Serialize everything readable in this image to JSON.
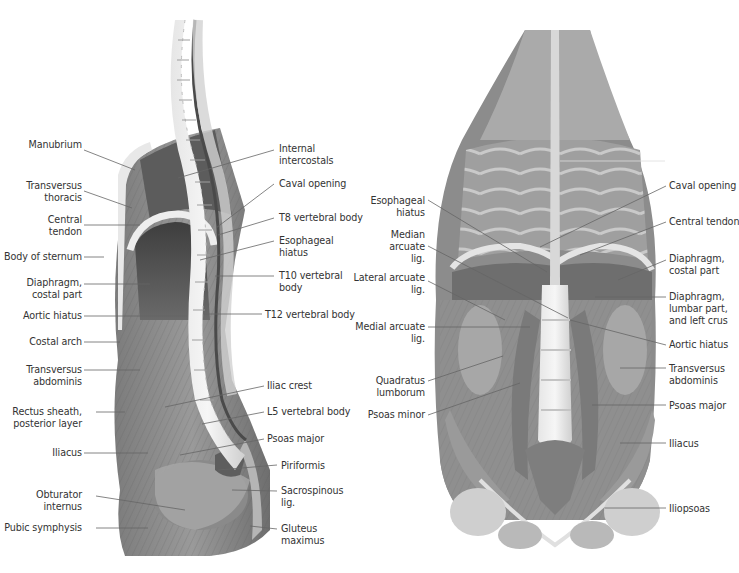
{
  "figure": {
    "panels": [
      {
        "id": "lateral",
        "view": "Midsagittal section, left lateral view",
        "left_labels": [
          {
            "lines": [
              "Manubrium"
            ],
            "x": 22,
            "y": 144
          },
          {
            "lines": [
              "Transversus",
              "thoracis"
            ],
            "x": 22,
            "y": 182
          },
          {
            "lines": [
              "Central",
              "tendon"
            ],
            "x": 22,
            "y": 219
          },
          {
            "lines": [
              "Body of sternum"
            ],
            "x": 22,
            "y": 251
          },
          {
            "lines": [
              "Diaphragm,",
              "costal part"
            ],
            "x": 22,
            "y": 277
          },
          {
            "lines": [
              "Aortic hiatus"
            ],
            "x": 22,
            "y": 310
          },
          {
            "lines": [
              "Costal arch"
            ],
            "x": 22,
            "y": 337
          },
          {
            "lines": [
              "Transversus",
              "abdominis"
            ],
            "x": 22,
            "y": 365
          },
          {
            "lines": [
              "Rectus sheath,",
              "posterior layer"
            ],
            "x": 22,
            "y": 406
          },
          {
            "lines": [
              "Iliacus"
            ],
            "x": 22,
            "y": 448
          },
          {
            "lines": [
              "Obturator",
              "internus"
            ],
            "x": 22,
            "y": 490
          },
          {
            "lines": [
              "Pubic symphysis"
            ],
            "x": 22,
            "y": 523
          }
        ],
        "right_labels": [
          {
            "lines": [
              "Internal",
              "intercostals"
            ],
            "x": 279,
            "y": 143
          },
          {
            "lines": [
              "Caval opening"
            ],
            "x": 279,
            "y": 178
          },
          {
            "lines": [
              "T8 vertebral body"
            ],
            "x": 279,
            "y": 212
          },
          {
            "lines": [
              "Esophageal",
              "hiatus"
            ],
            "x": 279,
            "y": 235
          },
          {
            "lines": [
              "T10 vertebral",
              "body"
            ],
            "x": 279,
            "y": 270
          },
          {
            "lines": [
              "T12 vertebral body"
            ],
            "x": 265,
            "y": 309
          },
          {
            "lines": [
              "Iliac crest"
            ],
            "x": 267,
            "y": 380
          },
          {
            "lines": [
              "L5 vertebral body"
            ],
            "x": 267,
            "y": 406
          },
          {
            "lines": [
              "Psoas major"
            ],
            "x": 267,
            "y": 433
          },
          {
            "lines": [
              "Piriformis"
            ],
            "x": 281,
            "y": 460
          },
          {
            "lines": [
              "Sacrospinous",
              "lig."
            ],
            "x": 281,
            "y": 485
          },
          {
            "lines": [
              "Gluteus",
              "maximus"
            ],
            "x": 281,
            "y": 523
          }
        ]
      },
      {
        "id": "anterior",
        "view": "Posterior abdominal wall, anterior view",
        "left_labels": [
          {
            "lines": [
              "Esophageal",
              "hiatus"
            ],
            "x": 425,
            "y": 195
          },
          {
            "lines": [
              "Median",
              "arcuate",
              "lig."
            ],
            "x": 425,
            "y": 229
          },
          {
            "lines": [
              "Lateral arcuate",
              "lig."
            ],
            "x": 425,
            "y": 272
          },
          {
            "lines": [
              "Medial arcuate",
              "lig."
            ],
            "x": 425,
            "y": 321
          },
          {
            "lines": [
              "Quadratus",
              "lumborum"
            ],
            "x": 425,
            "y": 375
          },
          {
            "lines": [
              "Psoas minor"
            ],
            "x": 425,
            "y": 409
          }
        ],
        "right_labels": [
          {
            "lines": [
              "Caval opening"
            ],
            "x": 669,
            "y": 180
          },
          {
            "lines": [
              "Central tendon"
            ],
            "x": 669,
            "y": 216
          },
          {
            "lines": [
              "Diaphragm,",
              "costal part"
            ],
            "x": 669,
            "y": 253
          },
          {
            "lines": [
              "Diaphragm,",
              "lumbar part,",
              "and left crus"
            ],
            "x": 669,
            "y": 291
          },
          {
            "lines": [
              "Aortic hiatus"
            ],
            "x": 669,
            "y": 339
          },
          {
            "lines": [
              "Transversus",
              "abdominis"
            ],
            "x": 669,
            "y": 364
          },
          {
            "lines": [
              "Psoas major"
            ],
            "x": 669,
            "y": 400
          },
          {
            "lines": [
              "Iliacus"
            ],
            "x": 669,
            "y": 438
          },
          {
            "lines": [
              "Iliopsoas"
            ],
            "x": 669,
            "y": 503
          }
        ]
      }
    ],
    "colors": {
      "background": "#ffffff",
      "label_text": "#333333",
      "leader_line": "#666666"
    }
  }
}
